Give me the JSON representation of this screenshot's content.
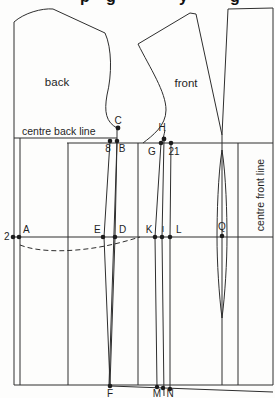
{
  "title_fragments": [
    "p",
    "g",
    "y",
    "g"
  ],
  "diagram": {
    "piece_labels": {
      "back": "back",
      "front": "front"
    },
    "line_labels": {
      "centre_back": "centre back line",
      "centre_front": "centre front line"
    },
    "points": {
      "A": "A",
      "B": "B",
      "C": "C",
      "D": "D",
      "E": "E",
      "F": "F",
      "G": "G",
      "H": "H",
      "I": "I",
      "K": "K",
      "L": "L",
      "M": "M",
      "N": "N",
      "Q": "Q"
    },
    "measurements": {
      "left_offset": "2",
      "back_dart": "8",
      "front_dart": "21"
    },
    "colors": {
      "line": "#2e2e2e",
      "background": "#fdfdfc"
    }
  }
}
